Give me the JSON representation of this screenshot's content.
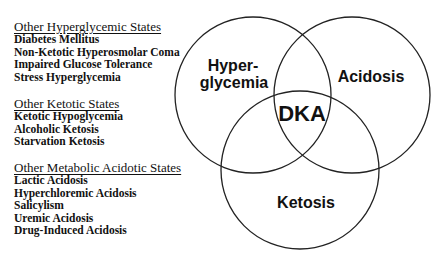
{
  "groups": [
    {
      "title": "Other Hyperglycemic States",
      "items": [
        "Diabetes Mellitus",
        "Non-Ketotic Hyperosmolar Coma",
        "Impaired Glucose Tolerance",
        "Stress Hyperglycemia"
      ]
    },
    {
      "title": "Other Ketotic States",
      "items": [
        "Ketotic Hypoglycemia",
        "Alcoholic Ketosis",
        "Starvation Ketosis"
      ]
    },
    {
      "title": "Other Metabolic Acidotic States",
      "items": [
        "Lactic Acidosis",
        "Hyperchloremic Acidosis",
        "Salicylism",
        "Uremic Acidosis",
        "Drug-Induced Acidosis"
      ]
    }
  ],
  "venn": {
    "circles": [
      {
        "name": "Hyperglycemia",
        "label_line1": "Hyper-",
        "label_line2": "glycemia",
        "cx": 253,
        "cy": 95,
        "r": 78
      },
      {
        "name": "Acidosis",
        "label": "Acidosis",
        "cx": 352,
        "cy": 95,
        "r": 78
      },
      {
        "name": "Ketosis",
        "label": "Ketosis",
        "cx": 300,
        "cy": 170,
        "r": 79
      }
    ],
    "intersection_label": "DKA",
    "stroke_color": "#222222"
  }
}
